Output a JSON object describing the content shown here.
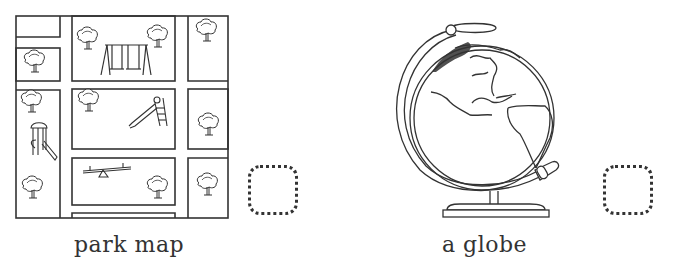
{
  "items": [
    {
      "label": "park map",
      "illustration": "park-map-illustration",
      "answer_box": {
        "checked": false
      }
    },
    {
      "label": "a globe",
      "illustration": "globe-illustration",
      "answer_box": {
        "checked": false
      }
    }
  ],
  "colors": {
    "line": "#333333",
    "background": "#ffffff"
  }
}
